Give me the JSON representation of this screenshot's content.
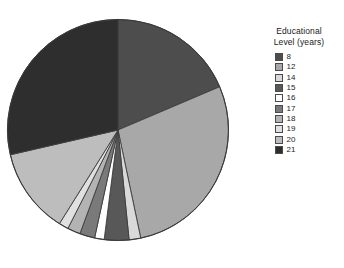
{
  "top_note": {
    "text": ""
  },
  "caption": {
    "text": ""
  },
  "legend": {
    "title_line1": "Educational",
    "title_line2": "Level (years)",
    "items": [
      {
        "label": "8",
        "color": "#4d4d4d"
      },
      {
        "label": "12",
        "color": "#a8a8a8"
      },
      {
        "label": "14",
        "color": "#d9d9d9"
      },
      {
        "label": "15",
        "color": "#585858"
      },
      {
        "label": "16",
        "color": "#ffffff"
      },
      {
        "label": "17",
        "color": "#7a7a7a"
      },
      {
        "label": "18",
        "color": "#b3b3b3"
      },
      {
        "label": "19",
        "color": "#e0e0e0"
      },
      {
        "label": "20",
        "color": "#bdbdbd"
      },
      {
        "label": "21",
        "color": "#2e2e2e"
      }
    ]
  },
  "chart_data": {
    "type": "pie",
    "title": "",
    "legend_title": "Educational Level (years)",
    "legend_position": "right",
    "grid": false,
    "start_angle_deg": 0,
    "direction": "clockwise",
    "categories": [
      "8",
      "12",
      "14",
      "15",
      "16",
      "17",
      "18",
      "19",
      "20",
      "21"
    ],
    "values": [
      18.6,
      28.1,
      1.7,
      3.6,
      1.4,
      2.2,
      1.9,
      1.4,
      12.5,
      28.6
    ],
    "colors": [
      "#4d4d4d",
      "#a8a8a8",
      "#d9d9d9",
      "#585858",
      "#ffffff",
      "#7a7a7a",
      "#b3b3b3",
      "#e0e0e0",
      "#bdbdbd",
      "#2e2e2e"
    ],
    "units": "percent",
    "xlabel": "",
    "ylabel": ""
  }
}
